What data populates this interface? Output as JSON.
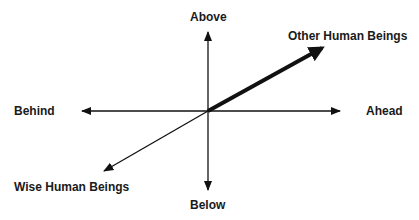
{
  "diagram": {
    "labels": {
      "above": "Above",
      "below": "Below",
      "behind": "Behind",
      "ahead": "Ahead",
      "other": "Other Human Beings",
      "wise": "Wise Human Beings"
    },
    "colors": {
      "line": "#111111",
      "background": "#ffffff"
    }
  }
}
